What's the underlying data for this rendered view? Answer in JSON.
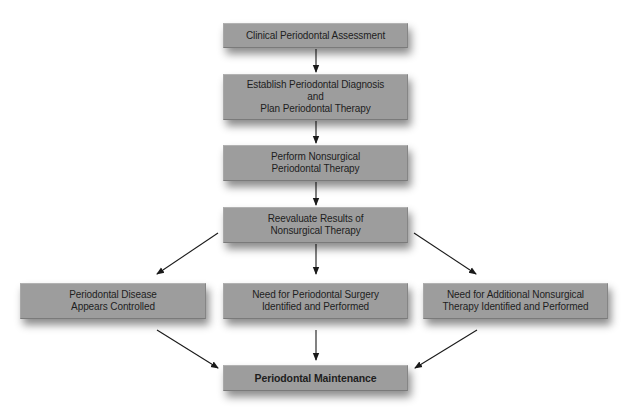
{
  "diagram": {
    "type": "flowchart",
    "colors": {
      "box_fill": "#9d9d9d",
      "text": "#1e1e1e",
      "arrow": "#1a1a1a",
      "background": "#ffffff"
    },
    "nodes": {
      "clinical_assessment": {
        "lines": [
          "Clinical Periodontal Assessment"
        ]
      },
      "establish_diagnosis": {
        "lines": [
          "Establish Periodontal Diagnosis",
          "and",
          "Plan Periodontal Therapy"
        ]
      },
      "perform_nonsurgical": {
        "lines": [
          "Perform Nonsurgical",
          "Periodontal Therapy"
        ]
      },
      "reevaluate": {
        "lines": [
          "Reevaluate Results of",
          "Nonsurgical Therapy"
        ]
      },
      "disease_controlled": {
        "lines": [
          "Periodontal Disease",
          "Appears Controlled"
        ]
      },
      "surgery_needed": {
        "lines": [
          "Need for Periodontal Surgery",
          "Identified and Performed"
        ]
      },
      "additional_nonsurgical": {
        "lines": [
          "Need for Additional Nonsurgical",
          "Therapy Identified and Performed"
        ]
      },
      "maintenance": {
        "lines": [
          "Periodontal Maintenance"
        ]
      }
    },
    "edges": [
      {
        "from": "clinical_assessment",
        "to": "establish_diagnosis"
      },
      {
        "from": "establish_diagnosis",
        "to": "perform_nonsurgical"
      },
      {
        "from": "perform_nonsurgical",
        "to": "reevaluate"
      },
      {
        "from": "reevaluate",
        "to": "disease_controlled"
      },
      {
        "from": "reevaluate",
        "to": "surgery_needed"
      },
      {
        "from": "reevaluate",
        "to": "additional_nonsurgical"
      },
      {
        "from": "disease_controlled",
        "to": "maintenance"
      },
      {
        "from": "surgery_needed",
        "to": "maintenance"
      },
      {
        "from": "additional_nonsurgical",
        "to": "maintenance"
      }
    ]
  }
}
